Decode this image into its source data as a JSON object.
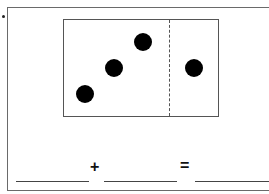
{
  "worksheet": {
    "bullet": "•",
    "dots": {
      "left_part": [
        {
          "cx": 22,
          "cy": 75
        },
        {
          "cx": 51,
          "cy": 49
        },
        {
          "cx": 80,
          "cy": 23
        }
      ],
      "right_part": [
        {
          "cx": 131,
          "cy": 49
        }
      ],
      "left_count": 3,
      "right_count": 1
    },
    "equation": {
      "blank_1": "",
      "plus": "+",
      "blank_2": "",
      "equals": "=",
      "blank_3": ""
    }
  }
}
